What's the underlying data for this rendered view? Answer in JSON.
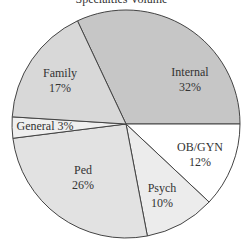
{
  "chart_data": {
    "type": "pie",
    "title": "Specialties Volume",
    "categories": [
      "Internal",
      "OB/GYN",
      "Psych",
      "Ped",
      "General",
      "Family"
    ],
    "values": [
      32,
      12,
      10,
      26,
      3,
      17
    ],
    "labels": [
      {
        "name": "Internal",
        "pct": "32%"
      },
      {
        "name": "OB/GYN",
        "pct": "12%"
      },
      {
        "name": "Psych",
        "pct": "10%"
      },
      {
        "name": "Ped",
        "pct": "26%"
      },
      {
        "name": "General 3%",
        "pct": ""
      },
      {
        "name": "Family",
        "pct": "17%"
      }
    ],
    "colors": [
      "#c6c6c6",
      "#ffffff",
      "#ececec",
      "#e2e2e2",
      "#efefef",
      "#d8d8d8"
    ],
    "legend": "none"
  }
}
